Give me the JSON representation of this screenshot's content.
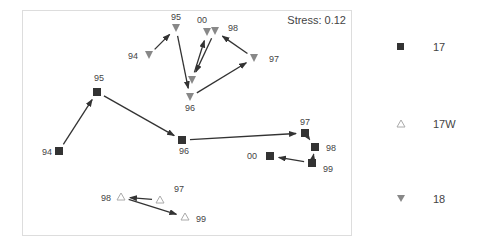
{
  "chart_data": {
    "type": "scatter",
    "title": "",
    "annotation": "Stress: 0.12",
    "xlabel": "",
    "ylabel": "",
    "grid": false,
    "legend_position": "right",
    "series": [
      {
        "name": "17",
        "marker": "square",
        "color": "#333333",
        "points": [
          {
            "label": "94",
            "x": 59,
            "y": 151
          },
          {
            "label": "95",
            "x": 97,
            "y": 92
          },
          {
            "label": "96",
            "x": 182,
            "y": 140
          },
          {
            "label": "97",
            "x": 305,
            "y": 133
          },
          {
            "label": "98",
            "x": 315,
            "y": 147
          },
          {
            "label": "99",
            "x": 312,
            "y": 163
          },
          {
            "label": "00",
            "x": 270,
            "y": 156
          }
        ],
        "path": [
          "94",
          "95",
          "96",
          "97",
          "98",
          "99",
          "00"
        ]
      },
      {
        "name": "17W",
        "marker": "triangle-up-open",
        "color": "#aaaaaa",
        "points": [
          {
            "label": "97",
            "x": 160,
            "y": 200
          },
          {
            "label": "98",
            "x": 121,
            "y": 197
          },
          {
            "label": "99",
            "x": 185,
            "y": 217
          }
        ],
        "path": [
          "97",
          "98",
          "99"
        ]
      },
      {
        "name": "18",
        "marker": "triangle-down",
        "color": "#888888",
        "points": [
          {
            "label": "94",
            "x": 149,
            "y": 55
          },
          {
            "label": "95",
            "x": 176,
            "y": 28
          },
          {
            "label": "96",
            "x": 190,
            "y": 97
          },
          {
            "label": "97",
            "x": 254,
            "y": 58
          },
          {
            "label": "98",
            "x": 215,
            "y": 31
          },
          {
            "label": "99",
            "x": 192,
            "y": 80
          },
          {
            "label": "00",
            "x": 207,
            "y": 32
          }
        ],
        "path": [
          "94",
          "95",
          "96",
          "97",
          "98",
          "99",
          "00"
        ]
      }
    ]
  },
  "legend": [
    {
      "label": "17"
    },
    {
      "label": "17W"
    },
    {
      "label": "18"
    }
  ]
}
